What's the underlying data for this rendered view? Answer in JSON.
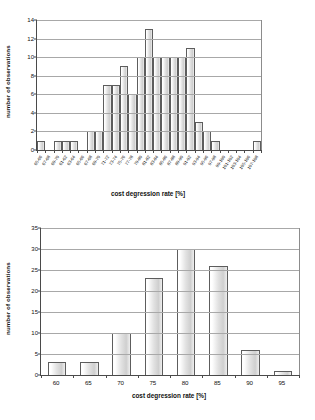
{
  "chart_data": [
    {
      "id": "top",
      "type": "bar",
      "title": "",
      "xlabel": "cost degression rate [%]",
      "ylabel": "number of observations",
      "ylim": [
        0,
        14
      ],
      "yticks": [
        0,
        2,
        4,
        6,
        8,
        10,
        12,
        14
      ],
      "grid": true,
      "legend": "none",
      "categories": [
        "65-66",
        "67-68",
        "69-70",
        "61-62",
        "63-64",
        "65-66",
        "67-68",
        "69-70",
        "71-72",
        "73-74",
        "75-76",
        "77-78",
        "79-80",
        "81-82",
        "83-84",
        "85-86",
        "87-88",
        "89-90",
        "91-92",
        "93-94",
        "95-96",
        "97-98",
        "99-100",
        "101-102",
        "103-104",
        "105-106",
        "107-108"
      ],
      "values": [
        1,
        0,
        1,
        1,
        1,
        0,
        2,
        2,
        7,
        7,
        9,
        6,
        10,
        13,
        10,
        10,
        10,
        10,
        11,
        3,
        2,
        1,
        0,
        0,
        0,
        0,
        1
      ]
    },
    {
      "id": "bottom",
      "type": "bar",
      "title": "",
      "xlabel": "cost degression rate [%]",
      "ylabel": "number of observations",
      "ylim": [
        0,
        35
      ],
      "yticks": [
        0,
        5,
        10,
        15,
        20,
        25,
        30,
        35
      ],
      "grid": true,
      "legend": "none",
      "categories": [
        "60",
        "65",
        "70",
        "75",
        "80",
        "85",
        "90",
        "95"
      ],
      "values": [
        3,
        3,
        10,
        23,
        30,
        26,
        6,
        1
      ]
    }
  ]
}
